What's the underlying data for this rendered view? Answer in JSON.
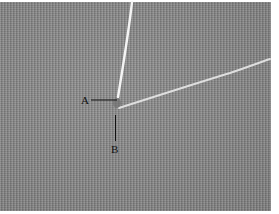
{
  "figure": {
    "labels": [
      {
        "id": "A",
        "text": "A"
      },
      {
        "id": "B",
        "text": "B"
      }
    ],
    "colors": {
      "fabric": "#8a8a8a",
      "thread": "#f2f2f2",
      "label": "#111111",
      "background": "#ffffff"
    }
  }
}
